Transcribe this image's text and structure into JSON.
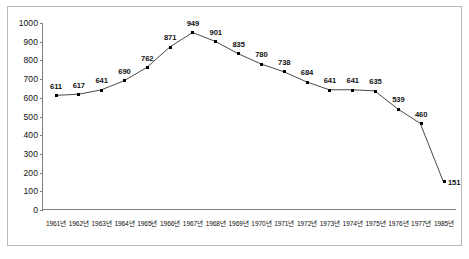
{
  "chart_data": {
    "type": "line",
    "title": "",
    "subtitle": "",
    "xlabel": "",
    "ylabel": "",
    "grid": false,
    "legend": "none",
    "ylim": [
      0,
      1000
    ],
    "yticks": [
      0,
      100,
      200,
      300,
      400,
      500,
      600,
      700,
      800,
      900,
      1000
    ],
    "ytick_labels": [
      "0",
      "100",
      "200",
      "300",
      "400",
      "500",
      "600",
      "700",
      "800",
      "900",
      "1000"
    ],
    "categories": [
      "1961년",
      "1962년",
      "1963년",
      "1964년",
      "1965년",
      "1966년",
      "1967년",
      "1968년",
      "1969년",
      "1970년",
      "1971년",
      "1972년",
      "1973년",
      "1974년",
      "1975년",
      "1976년",
      "1977년",
      "1985년"
    ],
    "values": [
      611,
      617,
      641,
      690,
      762,
      871,
      949,
      901,
      835,
      780,
      738,
      684,
      641,
      641,
      635,
      539,
      460,
      151
    ],
    "point_labels": [
      "611",
      "617",
      "641",
      "690",
      "762",
      "871",
      "949",
      "901",
      "835",
      "780",
      "738",
      "684",
      "641",
      "641",
      "635",
      "539",
      "460",
      "151"
    ],
    "series": [
      {
        "name": "series-1",
        "values": [
          611,
          617,
          641,
          690,
          762,
          871,
          949,
          901,
          835,
          780,
          738,
          684,
          641,
          641,
          635,
          539,
          460,
          151
        ],
        "line_color": "#333333",
        "marker_color": "#000000"
      }
    ],
    "colors": {
      "line": "#333333",
      "marker": "#000000",
      "axis": "#808080",
      "frame": "#b9b9b9",
      "text": "#111111",
      "background": "#ffffff"
    }
  }
}
